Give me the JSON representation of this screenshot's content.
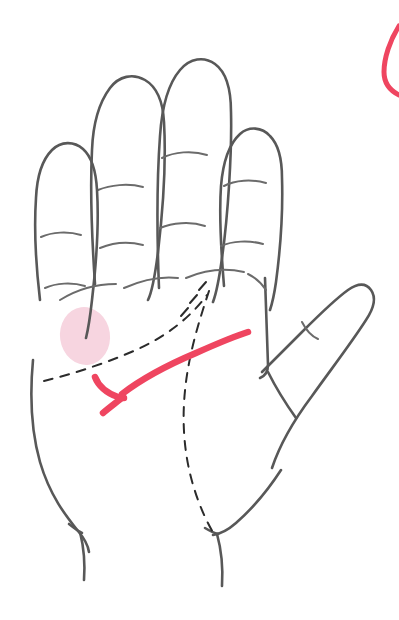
{
  "figure": {
    "background_color": "#ffffff",
    "canvas": {
      "width": 399,
      "height": 620
    }
  },
  "style": {
    "outline_color": "#585858",
    "outline_width": 2.6,
    "crease_color": "#6b6b6b",
    "crease_width": 2.0,
    "dashed_color": "#2b2b2b",
    "dashed_width": 2.0,
    "dash_pattern": "9 8",
    "highlight_line_color": "#ef4560",
    "highlight_line_width": 6.5,
    "highlight_region_color": "#f7d5e0",
    "edge_arc_color": "#ef4560",
    "edge_arc_width": 5.0
  },
  "annotations": {
    "highlighted_region": {
      "name": "hypothenar-eminence-highlight",
      "shape": "ellipse",
      "color": "#f7d5e0",
      "center_x": 85,
      "center_y": 336,
      "radius_x": 25,
      "radius_y": 29,
      "rotation_deg": -8
    },
    "highlighted_crease": {
      "name": "distal-palmar-crease-highlight",
      "color": "#ef4560",
      "description": "red emphasized palm crease sweeping from the thumb web down to the ulnar palm edge, with a short branch hook"
    },
    "edge_arc": {
      "name": "cropped-red-circle-arc",
      "color": "#ef4560",
      "description": "partial red circular arc cropped at the top right edge of the frame",
      "x": 383,
      "y_start": 26,
      "y_end": 94
    },
    "dashed_guides": {
      "name": "dashed-anatomical-guides",
      "color": "#2b2b2b",
      "description": "dashed proximal palmar crease and dashed thenar eminence boundary"
    }
  },
  "paths": {
    "palm_outline": "M 33 360 C 30 392 31 430 40 462 C 50 496 66 516 78 531 C 84 538 88 545 89 552",
    "palm_outline_wrist_left": "M 80 532 C 84 548 85 566 84 580",
    "palm_outline_right_edge": "M 265 278 C 266 312 267 340 268 365 C 268 372 265 376 260 378",
    "palm_lower_right": "M 213 535 C 220 534 228 530 236 523 C 252 509 268 490 281 470",
    "wrist_right_stroke": "M 217 534 C 222 552 223 570 222 586",
    "wrist_right_tick": "M 205 528 C 210 531 214 533 218 534",
    "wrist_left_tick": "M 69 524 C 74 528 78 531 82 533",
    "fingers": [
      {
        "name": "index-finger",
        "outline": "M 95 284 C 92 240 90 190 92 150 C 93 124 98 104 110 88 C 119 76 133 73 145 80 C 157 87 163 103 164 122 C 166 158 163 210 158 252 C 155 276 152 292 148 300",
        "creases": [
          "M 98 190 C 110 185 128 183 143 187",
          "M 100 248 C 112 243 128 241 143 245"
        ]
      },
      {
        "name": "middle-finger",
        "outline": "M 159 288 C 157 238 157 178 160 136 C 162 106 168 84 180 70 C 190 58 204 56 215 64 C 226 72 231 90 231 112 C 232 152 228 216 222 258 C 219 280 216 294 213 302",
        "creases": [
          "M 162 158 C 174 152 192 150 207 155",
          "M 160 228 C 172 223 190 221 205 226"
        ]
      },
      {
        "name": "ring-finger",
        "outline": "M 40 300 C 36 266 34 228 36 198 C 37 176 42 160 52 150 C 61 141 74 141 83 149 C 92 157 96 172 97 190 C 99 222 96 266 92 300 C 90 318 88 330 86 338",
        "creases": [
          "M 41 237 C 52 232 68 231 81 235",
          "M 45 288 C 56 283 72 282 85 286"
        ]
      },
      {
        "name": "little-finger",
        "outline": "M 224 286 C 221 250 219 214 221 186 C 223 162 229 144 240 134 C 249 126 262 127 270 136 C 279 145 282 160 282 178 C 283 210 280 252 276 282 C 274 296 272 304 270 310",
        "creases": [
          "M 224 186 C 235 180 252 179 266 183",
          "M 221 246 C 232 241 249 240 263 244"
        ]
      }
    ],
    "thumb_outline": "M 262 372 C 274 360 288 346 302 332 C 318 316 334 300 348 290 C 358 283 366 283 371 290 C 376 297 374 308 366 320 C 352 342 332 368 312 396 C 294 420 280 444 272 468",
    "thumb_lower": "M 268 372 C 276 388 286 404 296 418",
    "thumb_crease": "M 302 322 C 306 330 311 336 318 339",
    "palm_creases": [
      "M 60 300 C 76 290 96 284 116 284",
      "M 124 288 C 142 280 160 276 178 278",
      "M 186 278 C 205 270 226 268 244 272",
      "M 248 274 C 256 278 262 284 266 290"
    ],
    "palm_short_dashes": [
      "M 199 290 L 206 282",
      "M 190 303 L 197 295",
      "M 181 316 L 188 308"
    ],
    "dashed_proximal_crease": "M 44 381 C 72 374 104 364 136 350 C 165 337 190 318 207 295",
    "dashed_thenar_boundary": "M 209 291 C 200 318 190 350 186 382 C 181 420 184 456 194 488 C 200 508 208 524 214 534",
    "highlight_main": "M 248 332 C 232 337 214 345 196 353 C 170 364 144 377 122 394",
    "highlight_branch": "M 95 377 C 98 385 106 393 118 397 C 120 398 122 398 124 398",
    "highlight_tail": "M 123 397 C 117 402 110 407 103 413",
    "edge_arc": "M 399 26 C 390 40 384 58 384 72 C 384 82 389 90 399 95"
  }
}
